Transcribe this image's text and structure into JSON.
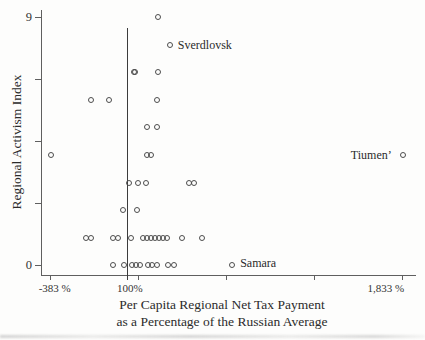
{
  "figure": {
    "ref_line": {
      "label": "100%"
    },
    "x_axis": {
      "title_line1": "Per Capita Regional Net Tax Payment",
      "title_line2": "as a Percentage of the Russian Average"
    },
    "colors": {
      "marker_stroke": "#4d4d4d",
      "axis": "#5f5f5f",
      "reference_line": "#3c3c3c",
      "text": "#2b2b2b",
      "background": "#fdfdfc"
    }
  },
  "chart_data": {
    "type": "scatter",
    "title": "",
    "xlabel": "Per Capita Regional Net Tax Payment as a Percentage of the Russian Average",
    "ylabel": "Regional Activism Index",
    "xlim": [
      -444,
      1910
    ],
    "ylim": [
      -0.33,
      9.26
    ],
    "x_ticks": [
      -383,
      171,
      725,
      1279,
      1833
    ],
    "x_tick_labels": [
      "-383 %",
      "",
      "",
      "",
      "1,833 %"
    ],
    "y_ticks": [
      0,
      2.25,
      4.5,
      6.75,
      9
    ],
    "y_tick_labels": [
      "0",
      "",
      "",
      "",
      "9"
    ],
    "ref_line_x": 100,
    "grid": false,
    "legend": false,
    "marker": "open-circle",
    "points": [
      {
        "pct": 294,
        "index": 9
      },
      {
        "pct": 367,
        "index": 8,
        "label": "Sverdlovsk",
        "label_side": "right"
      },
      {
        "pct": 144,
        "index": 7
      },
      {
        "pct": 150,
        "index": 7
      },
      {
        "pct": 294,
        "index": 7
      },
      {
        "pct": -131,
        "index": 6
      },
      {
        "pct": -16,
        "index": 6
      },
      {
        "pct": 287,
        "index": 6
      },
      {
        "pct": 221,
        "index": 5
      },
      {
        "pct": 284,
        "index": 5
      },
      {
        "pct": -383,
        "index": 4
      },
      {
        "pct": 226,
        "index": 4
      },
      {
        "pct": 251,
        "index": 4
      },
      {
        "pct": 1833,
        "index": 4,
        "label": "Tiumen’",
        "label_side": "left"
      },
      {
        "pct": 111,
        "index": 3
      },
      {
        "pct": 168,
        "index": 3
      },
      {
        "pct": 214,
        "index": 3
      },
      {
        "pct": 490,
        "index": 3
      },
      {
        "pct": 517,
        "index": 3
      },
      {
        "pct": 69,
        "index": 2
      },
      {
        "pct": 158,
        "index": 2
      },
      {
        "pct": -158,
        "index": 1
      },
      {
        "pct": -130,
        "index": 1
      },
      {
        "pct": 12,
        "index": 1
      },
      {
        "pct": 40,
        "index": 1
      },
      {
        "pct": 120,
        "index": 1
      },
      {
        "pct": 196,
        "index": 1
      },
      {
        "pct": 221,
        "index": 1
      },
      {
        "pct": 246,
        "index": 1
      },
      {
        "pct": 273,
        "index": 1
      },
      {
        "pct": 300,
        "index": 1
      },
      {
        "pct": 325,
        "index": 1
      },
      {
        "pct": 350,
        "index": 1
      },
      {
        "pct": 441,
        "index": 1
      },
      {
        "pct": 567,
        "index": 1
      },
      {
        "pct": 10,
        "index": 0
      },
      {
        "pct": 80,
        "index": 0
      },
      {
        "pct": 126,
        "index": 0
      },
      {
        "pct": 152,
        "index": 0
      },
      {
        "pct": 177,
        "index": 0
      },
      {
        "pct": 231,
        "index": 0
      },
      {
        "pct": 256,
        "index": 0
      },
      {
        "pct": 284,
        "index": 0
      },
      {
        "pct": 358,
        "index": 0
      },
      {
        "pct": 396,
        "index": 0
      },
      {
        "pct": 759,
        "index": 0,
        "label": "Samara",
        "label_side": "right",
        "label_dy": -2.5
      }
    ]
  }
}
